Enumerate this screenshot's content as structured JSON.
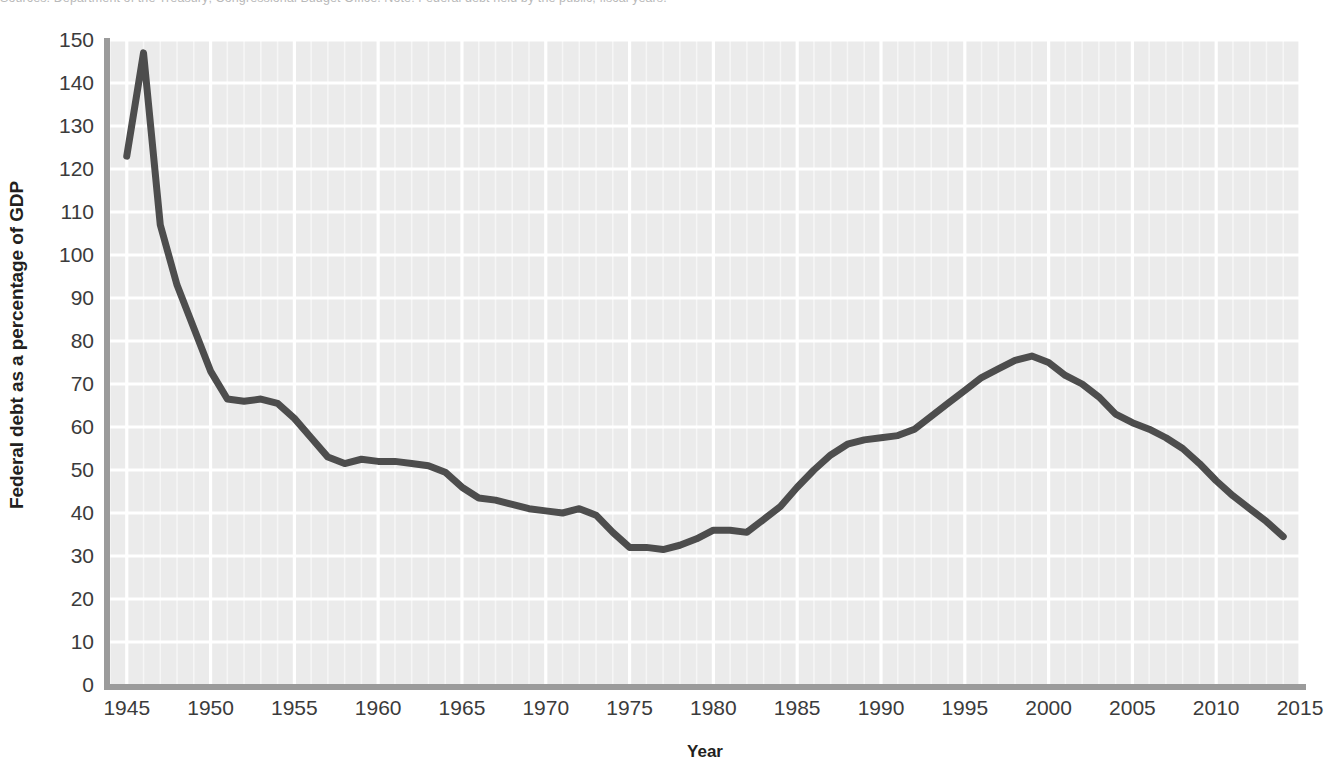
{
  "caption": {
    "text": "Sources: Department of the Treasury; Congressional Budget Office.    Note: Federal debt held by the public, fiscal years."
  },
  "chart_data": {
    "type": "line",
    "title": "",
    "xlabel": "Year",
    "ylabel": "Federal debt as a percentage of GDP",
    "xlim": [
      1944,
      2015
    ],
    "ylim": [
      0,
      150
    ],
    "xticks": [
      1945,
      1950,
      1955,
      1960,
      1965,
      1970,
      1975,
      1980,
      1985,
      1990,
      1995,
      2000,
      2005,
      2010,
      2015
    ],
    "yticks": [
      0,
      10,
      20,
      30,
      40,
      50,
      60,
      70,
      80,
      90,
      100,
      110,
      120,
      130,
      140,
      150
    ],
    "grid": "major horizontal white lines every 10 units; vertical white lines every year, heavier every 5 years",
    "legend": "none",
    "series": [
      {
        "name": "Federal debt held by the public",
        "color": "#4d4d4d",
        "x": [
          1945,
          1946,
          1947,
          1948,
          1949,
          1950,
          1951,
          1952,
          1953,
          1954,
          1955,
          1956,
          1957,
          1958,
          1959,
          1960,
          1961,
          1962,
          1963,
          1964,
          1965,
          1966,
          1967,
          1968,
          1969,
          1970,
          1971,
          1972,
          1973,
          1974,
          1975,
          1976,
          1977,
          1978,
          1979,
          1980,
          1981,
          1982,
          1983,
          1984,
          1985,
          1986,
          1987,
          1988,
          1989,
          1990,
          1991,
          1992,
          1993,
          1994,
          1995,
          1996,
          1997,
          1998,
          1999,
          2000,
          2001,
          2002,
          2003,
          2004,
          2005,
          2006,
          2007,
          2008,
          2009,
          2010,
          2011,
          2012,
          2013,
          2014
        ],
        "y": [
          123.0,
          147.0,
          107.0,
          93.0,
          83.0,
          73.0,
          66.5,
          66.0,
          66.5,
          65.5,
          62.0,
          57.5,
          53.0,
          51.5,
          52.5,
          52.0,
          52.0,
          51.5,
          51.0,
          49.5,
          46.0,
          43.5,
          43.0,
          42.0,
          41.0,
          40.5,
          40.0,
          41.0,
          39.5,
          35.5,
          32.0,
          32.0,
          31.5,
          32.5,
          34.0,
          36.0,
          36.0,
          35.5,
          38.5,
          41.5,
          46.0,
          50.0,
          53.5,
          56.0,
          57.0,
          57.5,
          58.0,
          59.5,
          62.5,
          65.5,
          68.5,
          71.5,
          73.5,
          75.5,
          76.5,
          75.0,
          72.0,
          70.0,
          67.0,
          63.0,
          61.0,
          59.5,
          57.5,
          55.0,
          51.5,
          47.5,
          44.0,
          41.0,
          38.0,
          34.5
        ]
      }
    ],
    "annotations": [
      {
        "label": "post-WWII peak",
        "x": 1946,
        "y": 147.0
      },
      {
        "label": "mid-1970s trough",
        "x": 1977,
        "y": 31.5
      },
      {
        "label": "mid-1990s peak",
        "x": 1999,
        "y": 76.5
      }
    ]
  },
  "axis": {
    "y_tick_labels": [
      "150",
      "140",
      "130",
      "120",
      "110",
      "100",
      "90",
      "80",
      "70",
      "60",
      "50",
      "40",
      "30",
      "20",
      "10",
      "0"
    ],
    "x_tick_labels": [
      "1945",
      "1950",
      "1955",
      "1960",
      "1965",
      "1970",
      "1975",
      "1980",
      "1985",
      "1990",
      "1995",
      "2000",
      "2005",
      "2010",
      "2015"
    ]
  },
  "colors": {
    "line": "#4d4d4d",
    "plot_background": "#ebebeb",
    "gridline": "#ffffff",
    "axis_spine": "#9b9b9b",
    "tick_text": "#3b3b3b",
    "title_text": "#231f20"
  }
}
